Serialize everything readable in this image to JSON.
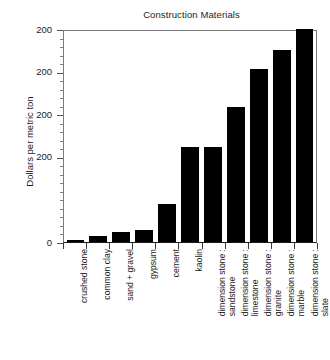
{
  "chart_data": {
    "type": "bar",
    "title": "Construction Materials",
    "xlabel": "",
    "ylabel": "Dollars per metric ton",
    "categories": [
      "crushed stone",
      "common clay",
      "sand + gravel",
      "gypsum",
      "cement",
      "kaolin",
      "dimension stone : sandstone",
      "dimension stone : limestone",
      "dimension stone : granite",
      "dimension stone : marble",
      "dimension stone : slate"
    ],
    "category_lines": [
      [
        "crushed stone",
        ""
      ],
      [
        "common clay",
        ""
      ],
      [
        "sand + gravel",
        ""
      ],
      [
        "gypsum",
        ""
      ],
      [
        "cement",
        ""
      ],
      [
        "kaolin",
        ""
      ],
      [
        "dimension stone :",
        "sandstone"
      ],
      [
        "dimension stone :",
        "limestone"
      ],
      [
        "dimension stone :",
        "granite"
      ],
      [
        "dimension stone :",
        "marble"
      ],
      [
        "dimension stone :",
        "slate"
      ]
    ],
    "values": [
      2,
      7,
      12,
      14,
      45,
      112,
      112,
      158,
      203,
      225,
      250
    ],
    "ylim": [
      0,
      250
    ],
    "axis_top_value": 250,
    "ytick_labels": [
      "200",
      "200",
      "200",
      "200",
      "0"
    ],
    "ytick_positions": [
      250,
      200,
      150,
      100,
      0
    ],
    "minor_ticks_per_interval": 4,
    "grid": false,
    "legend": "none",
    "bar_color": "#000000",
    "axis_color": "#7a7a7a",
    "text_color": "#1c1c1c"
  }
}
